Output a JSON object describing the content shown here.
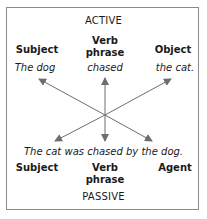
{
  "active": {
    "title": "ACTIVE",
    "headers": {
      "subject": "Subject",
      "verb_line1": "Verb",
      "verb_line2": "phrase",
      "object": "Object"
    },
    "sentence": {
      "subject": "The dog",
      "verb": "chased",
      "object": "the cat."
    }
  },
  "passive": {
    "title": "PASSIVE",
    "sentence": "The cat was chased by the dog.",
    "headers": {
      "subject": "Subject",
      "verb_line1": "Verb",
      "verb_line2": "phrase",
      "agent": "Agent"
    }
  },
  "colors": {
    "arrow": "#6e6e6e",
    "border": "#8a8a8a",
    "text": "#1a1a1a"
  }
}
